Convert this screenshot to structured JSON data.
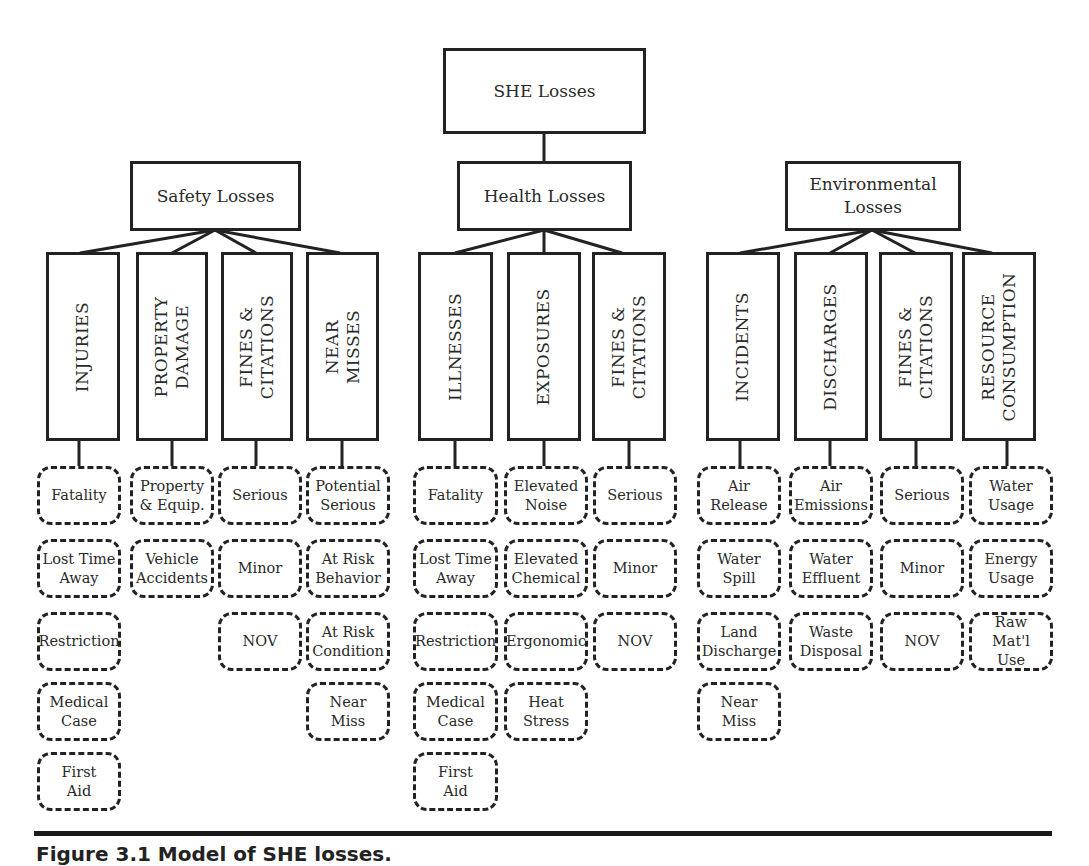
{
  "root": {
    "label": "SHE Losses"
  },
  "groups": [
    {
      "label": "Safety Losses",
      "categories": [
        {
          "label": "INJURIES",
          "items": [
            "Fatality",
            "Lost Time\nAway",
            "Restriction",
            "Medical\nCase",
            "First\nAid"
          ]
        },
        {
          "label": "PROPERTY\nDAMAGE",
          "items": [
            "Property\n& Equip.",
            "Vehicle\nAccidents"
          ]
        },
        {
          "label": "FINES &\nCITATIONS",
          "items": [
            "Serious",
            "Minor",
            "NOV"
          ]
        },
        {
          "label": "NEAR\nMISSES",
          "items": [
            "Potential\nSerious",
            "At Risk\nBehavior",
            "At Risk\nCondition",
            "Near\nMiss"
          ]
        }
      ]
    },
    {
      "label": "Health Losses",
      "categories": [
        {
          "label": "ILLNESSES",
          "items": [
            "Fatality",
            "Lost Time\nAway",
            "Restriction",
            "Medical\nCase",
            "First\nAid"
          ]
        },
        {
          "label": "EXPOSURES",
          "items": [
            "Elevated\nNoise",
            "Elevated\nChemical",
            "Ergonomic",
            "Heat\nStress"
          ]
        },
        {
          "label": "FINES &\nCITATIONS",
          "items": [
            "Serious",
            "Minor",
            "NOV"
          ]
        }
      ]
    },
    {
      "label": "Environmental\nLosses",
      "categories": [
        {
          "label": "INCIDENTS",
          "items": [
            "Air\nRelease",
            "Water\nSpill",
            "Land\nDischarge",
            "Near\nMiss"
          ]
        },
        {
          "label": "DISCHARGES",
          "items": [
            "Air\nEmissions",
            "Water\nEffluent",
            "Waste\nDisposal"
          ]
        },
        {
          "label": "FINES &\nCITATIONS",
          "items": [
            "Serious",
            "Minor",
            "NOV"
          ]
        },
        {
          "label": "RESOURCE\nCONSUMPTION",
          "items": [
            "Water\nUsage",
            "Energy\nUsage",
            "Raw Mat'l\nUse"
          ]
        }
      ]
    }
  ],
  "caption": "Figure 3.1   Model of SHE losses."
}
